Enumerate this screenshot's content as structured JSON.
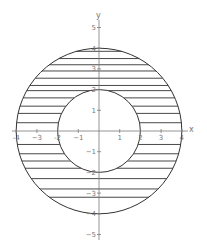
{
  "figure": {
    "x_axis_label": "x",
    "y_axis_label": "y",
    "x_ticks": [
      -4,
      -3,
      -2,
      -1,
      1,
      2,
      3,
      4
    ],
    "x_tick_labels": [
      "-4",
      "−3",
      "-2",
      "−1",
      "1",
      "2",
      "3",
      "4"
    ],
    "y_ticks": [
      5,
      4,
      3,
      2,
      1,
      -1,
      -2,
      -3,
      -4,
      -5
    ],
    "y_tick_labels": [
      "5",
      "4",
      "3",
      "2",
      "1",
      "−1",
      "−2",
      "−3",
      "−4",
      "−5"
    ],
    "outer_circle": {
      "radius": 4
    },
    "inner_circle": {
      "radius": 2
    },
    "hatch_y_values": [
      3.85,
      3.5,
      3.2,
      2.9,
      2.55,
      2.2,
      1.95,
      1.6,
      1.2,
      0.85,
      0.4,
      -0.65,
      -1.1,
      -1.45,
      -1.8,
      -2.3,
      -2.8,
      -3.2
    ],
    "colors": {
      "curve": "#333333",
      "axis": "#7a7a7a",
      "label": "#777777",
      "background": "#ffffff"
    }
  }
}
